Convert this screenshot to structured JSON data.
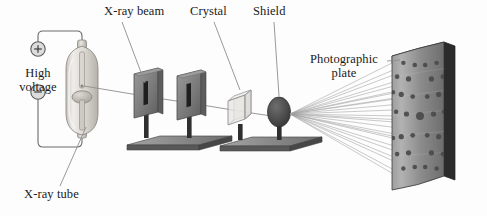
{
  "figure": {
    "background_color": "#fdfdfd"
  },
  "labels": {
    "xray_beam": "X-ray beam",
    "crystal": "Crystal",
    "shield": "Shield",
    "photographic_plate": "Photographic\nplate",
    "high_voltage": "High\nvoltage",
    "xray_tube": "X-ray tube",
    "plus_terminal": "+",
    "minus_terminal": "–"
  },
  "colors": {
    "ink": "#1a1a1a",
    "leader_line": "#8d8d8d",
    "glass_light": "#eceae6",
    "glass_mid": "#d5d2cc",
    "glass_dark": "#b4b0a9",
    "metal_light": "#b9b9b9",
    "metal_mid": "#8f8f8f",
    "metal_dark": "#595959",
    "plate_face_light": "#a8a8a8",
    "plate_face_dark": "#6f6f6f",
    "plate_edge": "#2b2b2b",
    "spot": "#4a4a4a",
    "shield_body": "#4b4b4b",
    "crystal_face": "#e3e3e0",
    "crystal_edge": "#9a9a9a",
    "ray": "#9b9b9b",
    "wire": "#6b6b6b"
  },
  "components": {
    "xray_tube": {
      "name": "X-ray tube",
      "description": "Evacuated glass envelope with anode and cathode"
    },
    "high_voltage_supply": {
      "name": "High voltage",
      "terminals": [
        "+",
        "–"
      ]
    },
    "collimator": {
      "name": "Collimator slits",
      "plate_count": 2,
      "slit_orientation": "vertical"
    },
    "crystal": {
      "name": "Crystal",
      "shape": "cube",
      "rendering": "transparent wireframe"
    },
    "shield": {
      "name": "Shield",
      "shape": "ellipse",
      "purpose": "blocks direct beam"
    },
    "photographic_plate": {
      "name": "Photographic plate",
      "shape": "curved rectangular panel",
      "pattern": "Laue diffraction spots"
    }
  },
  "chart_data": {
    "type": "scatter",
    "xlabel": "",
    "ylabel": "",
    "note": "Symmetric array of diffraction spots about a bright central beam stop",
    "spots": [
      {
        "x": 0,
        "y": 0,
        "r": 4.0
      },
      {
        "x": -26,
        "y": -2,
        "r": 2.6
      },
      {
        "x": 26,
        "y": -2,
        "r": 2.6
      },
      {
        "x": -46,
        "y": -4,
        "r": 2.2
      },
      {
        "x": 46,
        "y": -4,
        "r": 2.2
      },
      {
        "x": -14,
        "y": -22,
        "r": 2.4
      },
      {
        "x": 14,
        "y": -22,
        "r": 2.4
      },
      {
        "x": -36,
        "y": -24,
        "r": 2.6
      },
      {
        "x": 36,
        "y": -24,
        "r": 2.6
      },
      {
        "x": -52,
        "y": -26,
        "r": 2.2
      },
      {
        "x": 52,
        "y": -26,
        "r": 2.2
      },
      {
        "x": -22,
        "y": -42,
        "r": 2.6
      },
      {
        "x": 22,
        "y": -42,
        "r": 2.6
      },
      {
        "x": -44,
        "y": -44,
        "r": 2.3
      },
      {
        "x": 44,
        "y": -44,
        "r": 2.3
      },
      {
        "x": -10,
        "y": -58,
        "r": 2.3
      },
      {
        "x": 10,
        "y": -58,
        "r": 2.3
      },
      {
        "x": -32,
        "y": -60,
        "r": 2.2
      },
      {
        "x": 32,
        "y": -60,
        "r": 2.2
      },
      {
        "x": -14,
        "y": 22,
        "r": 2.4
      },
      {
        "x": 14,
        "y": 22,
        "r": 2.4
      },
      {
        "x": -36,
        "y": 24,
        "r": 2.6
      },
      {
        "x": 36,
        "y": 24,
        "r": 2.6
      },
      {
        "x": -52,
        "y": 26,
        "r": 2.2
      },
      {
        "x": 52,
        "y": 26,
        "r": 2.2
      },
      {
        "x": -22,
        "y": 42,
        "r": 2.6
      },
      {
        "x": 22,
        "y": 42,
        "r": 2.6
      },
      {
        "x": -44,
        "y": 44,
        "r": 2.3
      },
      {
        "x": 44,
        "y": 44,
        "r": 2.3
      },
      {
        "x": -10,
        "y": 58,
        "r": 2.3
      },
      {
        "x": 10,
        "y": 58,
        "r": 2.3
      },
      {
        "x": -32,
        "y": 60,
        "r": 2.2
      },
      {
        "x": 32,
        "y": 60,
        "r": 2.2
      }
    ]
  }
}
